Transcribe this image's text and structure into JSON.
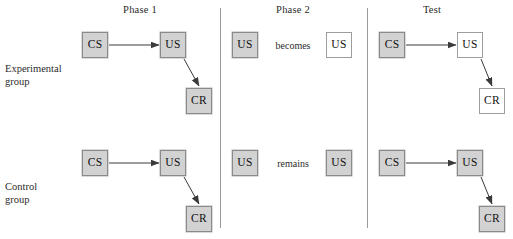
{
  "diagram": {
    "columns": [
      {
        "id": "phase1",
        "label": "Phase 1"
      },
      {
        "id": "phase2",
        "label": "Phase 2"
      },
      {
        "id": "test",
        "label": "Test"
      }
    ],
    "groups": [
      {
        "id": "experimental",
        "line1": "Experimental",
        "line2": "group"
      },
      {
        "id": "control",
        "line1": "Control",
        "line2": "group"
      }
    ],
    "colors": {
      "shaded_fill": "#d2d2d2",
      "shaded_border": "#8a8a8a",
      "plain_fill": "#ffffff",
      "plain_border": "#9d9d9d",
      "divider": "#9a9a9a",
      "text": "#2b2b2b",
      "arrow": "#3a3a3a"
    },
    "rows": [
      {
        "group": "experimental",
        "phase1": {
          "cs": {
            "label": "CS",
            "style": "shaded"
          },
          "us": {
            "label": "US",
            "style": "shaded"
          },
          "cr": {
            "label": "CR",
            "style": "shaded"
          }
        },
        "phase2": {
          "before": {
            "label": "US",
            "style": "shaded"
          },
          "relation": "becomes",
          "after": {
            "label": "US",
            "style": "plain"
          }
        },
        "test": {
          "cs": {
            "label": "CS",
            "style": "shaded"
          },
          "us": {
            "label": "US",
            "style": "plain"
          },
          "cr": {
            "label": "CR",
            "style": "plain"
          }
        }
      },
      {
        "group": "control",
        "phase1": {
          "cs": {
            "label": "CS",
            "style": "shaded"
          },
          "us": {
            "label": "US",
            "style": "shaded"
          },
          "cr": {
            "label": "CR",
            "style": "shaded"
          }
        },
        "phase2": {
          "before": {
            "label": "US",
            "style": "shaded"
          },
          "relation": "remains",
          "after": {
            "label": "US",
            "style": "shaded"
          }
        },
        "test": {
          "cs": {
            "label": "CS",
            "style": "shaded"
          },
          "us": {
            "label": "US",
            "style": "shaded"
          },
          "cr": {
            "label": "CR",
            "style": "shaded"
          }
        }
      }
    ]
  }
}
